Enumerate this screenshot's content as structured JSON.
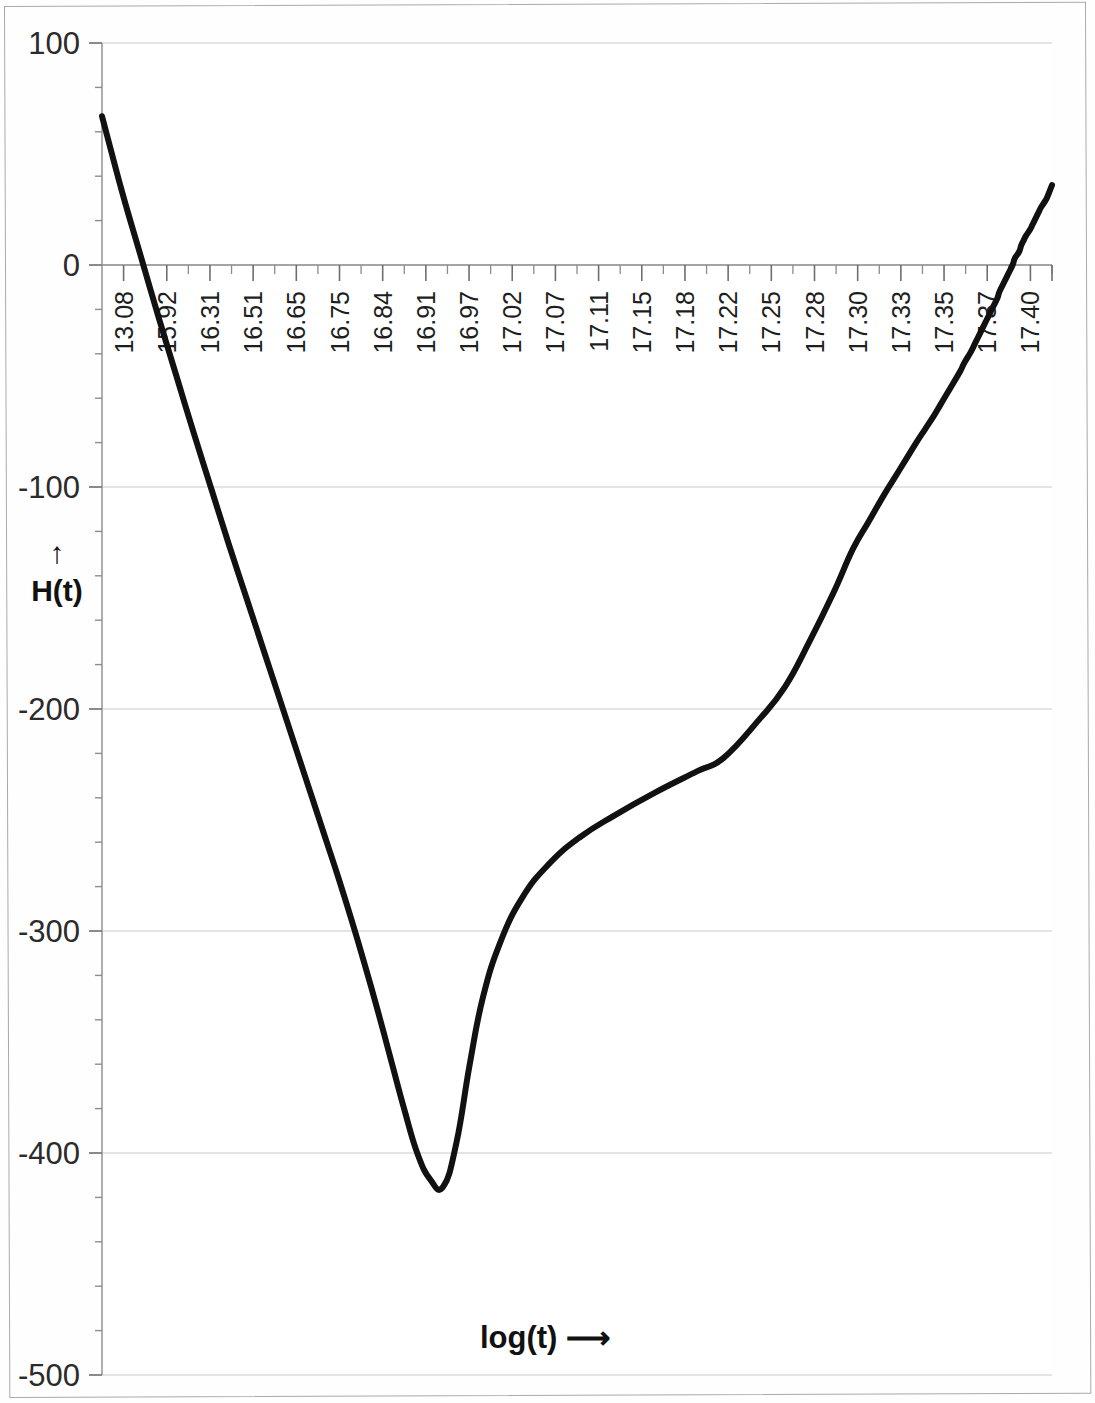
{
  "chart_data": {
    "type": "line",
    "title": "",
    "subtitle": "",
    "xlabel": "log(t)  ⟶",
    "ylabel": "H(t)",
    "ylabel_arrow": "↑",
    "xlim": [
      13.08,
      17.42
    ],
    "ylim": [
      -500,
      100
    ],
    "grid": true,
    "grid_axis": "y",
    "legend": null,
    "legend_position": "none",
    "y_ticks": [
      100,
      0,
      -100,
      -200,
      -300,
      -400,
      -500
    ],
    "y_tick_labels": [
      "100",
      "0",
      "-100",
      "-200",
      "-300",
      "-400",
      "-500"
    ],
    "y_minor_tick_count_between": 4,
    "x_tick_labels": [
      "13.08",
      "15.92",
      "16.31",
      "16.51",
      "16.65",
      "16.75",
      "16.84",
      "16.91",
      "16.97",
      "17.02",
      "17.07",
      "17.11",
      "17.15",
      "17.18",
      "17.22",
      "17.25",
      "17.28",
      "17.30",
      "17.33",
      "17.35",
      "17.37",
      "17.40"
    ],
    "x_tick_label_orientation": "vertical",
    "series": [
      {
        "name": "H(t)",
        "color": "#111111",
        "line_width": 6,
        "x": [
          13.08,
          13.12,
          13.18,
          13.26,
          13.34,
          13.42,
          13.5,
          13.58,
          13.66,
          13.74,
          13.8,
          13.86,
          13.92,
          13.98,
          14.04,
          14.1,
          14.16,
          14.22,
          14.28,
          14.34,
          14.4,
          14.46,
          14.52,
          14.58,
          14.64,
          14.7,
          14.76,
          14.82,
          14.9,
          15.0,
          15.12,
          15.26,
          15.42,
          15.6,
          15.8,
          15.92,
          16.08,
          16.2,
          16.31,
          16.42,
          16.51,
          16.58,
          16.65,
          16.7,
          16.75,
          16.8,
          16.84,
          16.88,
          16.91,
          16.94,
          16.97,
          17.0,
          17.02,
          17.05,
          17.07,
          17.09,
          17.11,
          17.13,
          17.15,
          17.17,
          17.18,
          17.2,
          17.22,
          17.24,
          17.25,
          17.27,
          17.28,
          17.29,
          17.3,
          17.32,
          17.33,
          17.34,
          17.35,
          17.36,
          17.37,
          17.39,
          17.4,
          17.42
        ],
        "y": [
          67,
          52,
          30,
          3,
          -24,
          -50,
          -76,
          -101,
          -126,
          -150,
          -168,
          -186,
          -204,
          -222,
          -240,
          -258,
          -276,
          -295,
          -315,
          -336,
          -358,
          -380,
          -400,
          -412,
          -415,
          -395,
          -360,
          -330,
          -305,
          -285,
          -270,
          -258,
          -248,
          -238,
          -228,
          -222,
          -205,
          -190,
          -170,
          -148,
          -128,
          -116,
          -104,
          -96,
          -88,
          -80,
          -74,
          -68,
          -63,
          -58,
          -53,
          -48,
          -44,
          -39,
          -35,
          -31,
          -27,
          -23,
          -19,
          -15,
          -12,
          -8,
          -4,
          0,
          3,
          6,
          9,
          11,
          13,
          16,
          18,
          20,
          22,
          24,
          26,
          29,
          31,
          36
        ]
      }
    ],
    "annotations": {
      "minimum_value": -415,
      "maximum_value": 67,
      "zero_crossing_x": 17.25
    }
  },
  "axes": {
    "y_axis_label": "H(t)",
    "y_axis_arrow": "↑",
    "x_axis_label": "log(t)",
    "x_axis_arrow": "⟶"
  }
}
